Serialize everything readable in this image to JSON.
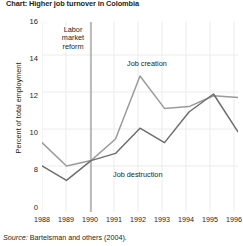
{
  "title": "Chart: Higher job turnover in Colombia",
  "source": {
    "prefix": "Source:",
    "text": "Bartelsman and others (2004)."
  },
  "annotations": {
    "reform": "Labor market reform",
    "reform_line1": "Labor",
    "reform_line2": "market",
    "reform_line3": "reform",
    "job_creation": "Job creation",
    "job_destruction": "Job destruction"
  },
  "axes": {
    "ylabel": "Percent of total employment",
    "yticks": [
      "16",
      "14",
      "12",
      "10",
      "8",
      "0"
    ],
    "xticks": [
      "1988",
      "1989",
      "1990",
      "1991",
      "1992",
      "1993",
      "1994",
      "1995",
      "1996"
    ]
  },
  "chart_data": {
    "type": "line",
    "title": "Higher job turnover in Colombia",
    "xlabel": "",
    "ylabel": "Percent of total employment",
    "x": [
      1988,
      1989,
      1990,
      1991,
      1992,
      1993,
      1994,
      1995,
      1996
    ],
    "ylim": [
      7.0,
      16
    ],
    "ytick_values": [
      16,
      14,
      12,
      10,
      8,
      0
    ],
    "axis_break": true,
    "grid": true,
    "legend": "inline-annotations",
    "series": [
      {
        "name": "Job creation",
        "color": "#9b9b9b",
        "values": [
          9.3,
          8.0,
          8.3,
          9.5,
          13.0,
          11.2,
          11.3,
          11.9,
          11.8
        ]
      },
      {
        "name": "Job destruction",
        "color": "#6e6e6e",
        "values": [
          8.0,
          7.2,
          8.3,
          8.7,
          10.1,
          9.3,
          11.0,
          12.0,
          9.9
        ]
      }
    ],
    "reference_line": {
      "label": "Labor market reform",
      "x": 1990,
      "orientation": "vertical",
      "color": "#808080"
    }
  },
  "colors": {
    "job_creation": "#9b9b9b",
    "job_destruction": "#6e6e6e",
    "grid": "#e8e8e8",
    "text": "#231f20",
    "reform_line": "#808080"
  }
}
